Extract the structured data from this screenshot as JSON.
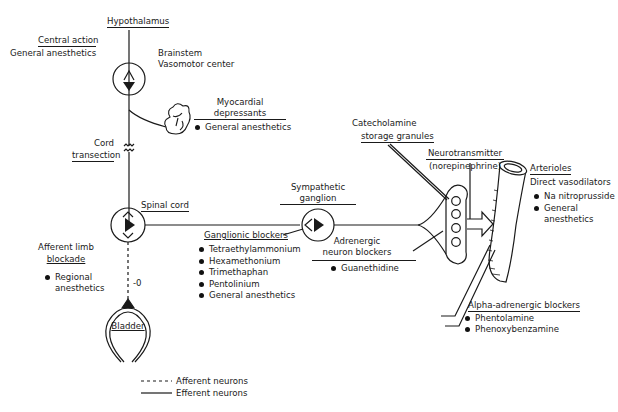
{
  "diagram": {
    "hypothalamus": "Hypothalamus",
    "central_action": {
      "title": "Central action",
      "agent": "General anesthetics"
    },
    "brainstem": {
      "line1": "Brainstem",
      "line2": "Vasomotor center"
    },
    "myocardial": {
      "title_line1": "Myocardial",
      "title_line2": "depressants",
      "items": [
        "General anesthetics"
      ]
    },
    "cord_transection": {
      "line1": "Cord",
      "line2": "transection"
    },
    "spinal_cord": "Spinal cord",
    "afferent_limb": {
      "line1": "Afferent limb",
      "line2": "blockade",
      "items": [
        "Regional anesthetics"
      ],
      "item_line1": "Regional",
      "item_line2": "anesthetics"
    },
    "bladder": {
      "label": "Bladder",
      "signal": "-0"
    },
    "ganglionic_blockers": {
      "title": "Ganglionic blockers",
      "items": [
        "Tetraethylammonium",
        "Hexamethonium",
        "Trimethaphan",
        "Pentolinium",
        "General anesthetics"
      ]
    },
    "sympathetic_ganglion": {
      "line1": "Sympathetic",
      "line2": "ganglion"
    },
    "adrenergic_neuron_blockers": {
      "line1": "Adrenergic",
      "line2": "neuron blockers",
      "items": [
        "Guanethidine"
      ]
    },
    "catecholamine": {
      "line1": "Catecholamine",
      "line2": "storage granules"
    },
    "neurotransmitter": {
      "line1": "Neurotransmitter",
      "line2": "(norepinephrine)"
    },
    "arterioles": {
      "title": "Arterioles",
      "subtitle": "Direct vasodilators",
      "items": [
        "Na nitroprusside",
        "General anesthetics"
      ],
      "item2_line1": "General",
      "item2_line2": "anesthetics"
    },
    "alpha_blockers": {
      "title": "Alpha-adrenergic blockers",
      "items": [
        "Phentolamine",
        "Phenoxybenzamine"
      ]
    },
    "legend": {
      "afferent": "Afferent neurons",
      "efferent": "Efferent neurons"
    }
  }
}
